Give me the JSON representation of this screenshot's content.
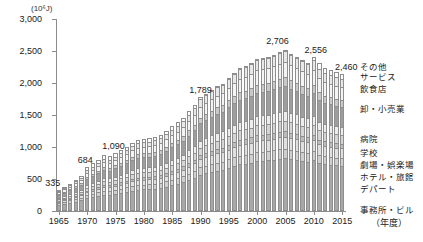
{
  "axis": {
    "unit_label": "(10⁶J)",
    "x_unit_label": "（年度）",
    "y_ticks": [
      "0",
      "500",
      "1,000",
      "1,500",
      "2,000",
      "2,500",
      "3,000"
    ],
    "x_ticks": [
      "1965",
      "1970",
      "1975",
      "1980",
      "1985",
      "1990",
      "1995",
      "2000",
      "2005",
      "2010",
      "2015"
    ]
  },
  "legend": {
    "items": [
      {
        "label": "その他",
        "color": "#e8e8e8"
      },
      {
        "label": "サービス",
        "color": "#f4f4f4"
      },
      {
        "label": "飲食店",
        "color": "#c9c9c9"
      },
      {
        "label": "卸・小売業",
        "color": "#9e9e9e"
      },
      {
        "label": "病院",
        "color": "#ededed"
      },
      {
        "label": "学校",
        "color": "#d5d5d5"
      },
      {
        "label": "劇場・娯楽場",
        "color": "#bdbdbd"
      },
      {
        "label": "ホテル・旅館",
        "color": "#e0e0e0"
      },
      {
        "label": "デパート",
        "color": "#cfcfcf"
      },
      {
        "label": "事務所・ビル",
        "color": "#a8a8a8"
      }
    ]
  },
  "chart_data": {
    "type": "bar",
    "stacked": true,
    "title": "",
    "xlabel": "（年度）",
    "ylabel": "(10⁶J)",
    "ylim": [
      0,
      3000
    ],
    "ytick_step": 500,
    "grid": false,
    "legend_position": "right",
    "categories": [
      1965,
      1966,
      1967,
      1968,
      1969,
      1970,
      1971,
      1972,
      1973,
      1974,
      1975,
      1976,
      1977,
      1978,
      1979,
      1980,
      1981,
      1982,
      1983,
      1984,
      1985,
      1986,
      1987,
      1988,
      1989,
      1990,
      1991,
      1992,
      1993,
      1994,
      1995,
      1996,
      1997,
      1998,
      1999,
      2000,
      2001,
      2002,
      2003,
      2004,
      2005,
      2006,
      2007,
      2008,
      2009,
      2010,
      2011,
      2012,
      2013,
      2014,
      2015
    ],
    "series": [
      {
        "name": "事務所・ビル",
        "color": "#a8a8a8",
        "values": [
          95,
          108,
          124,
          141,
          160,
          194,
          210,
          228,
          249,
          246,
          260,
          276,
          292,
          312,
          325,
          330,
          332,
          338,
          350,
          372,
          395,
          415,
          440,
          476,
          512,
          560,
          585,
          612,
          638,
          660,
          690,
          718,
          742,
          752,
          768,
          790,
          798,
          806,
          818,
          832,
          840,
          830,
          818,
          795,
          772,
          788,
          742,
          724,
          716,
          708,
          702
        ]
      },
      {
        "name": "デパート",
        "color": "#cfcfcf",
        "values": [
          30,
          33,
          37,
          41,
          46,
          55,
          58,
          62,
          66,
          65,
          67,
          70,
          72,
          76,
          78,
          79,
          79,
          80,
          82,
          86,
          90,
          93,
          97,
          103,
          109,
          117,
          120,
          124,
          128,
          131,
          135,
          139,
          142,
          143,
          145,
          148,
          148,
          149,
          150,
          152,
          153,
          150,
          147,
          142,
          137,
          139,
          130,
          126,
          124,
          122,
          120
        ]
      },
      {
        "name": "ホテル・旅館",
        "color": "#e0e0e0",
        "values": [
          22,
          25,
          28,
          32,
          36,
          44,
          48,
          52,
          57,
          57,
          61,
          65,
          69,
          74,
          78,
          80,
          81,
          83,
          86,
          91,
          96,
          101,
          107,
          115,
          123,
          133,
          139,
          145,
          151,
          156,
          163,
          169,
          175,
          177,
          181,
          186,
          187,
          188,
          190,
          193,
          195,
          192,
          188,
          182,
          176,
          179,
          168,
          163,
          160,
          157,
          155
        ]
      },
      {
        "name": "劇場・娯楽場",
        "color": "#bdbdbd",
        "values": [
          14,
          15,
          17,
          19,
          21,
          26,
          28,
          30,
          32,
          32,
          34,
          36,
          38,
          40,
          42,
          43,
          43,
          44,
          45,
          47,
          49,
          51,
          53,
          57,
          60,
          65,
          67,
          70,
          72,
          74,
          77,
          80,
          82,
          83,
          85,
          87,
          87,
          88,
          89,
          90,
          91,
          89,
          87,
          84,
          81,
          83,
          77,
          75,
          74,
          73,
          72
        ]
      },
      {
        "name": "学校",
        "color": "#d5d5d5",
        "values": [
          26,
          29,
          32,
          36,
          40,
          48,
          52,
          56,
          60,
          59,
          62,
          65,
          69,
          73,
          76,
          77,
          78,
          79,
          81,
          85,
          89,
          93,
          97,
          104,
          110,
          119,
          123,
          128,
          133,
          137,
          143,
          148,
          153,
          155,
          158,
          162,
          163,
          164,
          166,
          169,
          171,
          168,
          164,
          159,
          154,
          156,
          147,
          142,
          140,
          138,
          136
        ]
      },
      {
        "name": "病院",
        "color": "#ededed",
        "values": [
          23,
          26,
          29,
          32,
          36,
          43,
          47,
          50,
          54,
          54,
          57,
          60,
          63,
          67,
          70,
          71,
          72,
          73,
          75,
          79,
          83,
          86,
          91,
          97,
          103,
          111,
          115,
          120,
          125,
          129,
          134,
          139,
          143,
          145,
          148,
          152,
          153,
          154,
          156,
          158,
          160,
          157,
          154,
          149,
          144,
          146,
          138,
          134,
          131,
          129,
          128
        ]
      },
      {
        "name": "卸・小売業",
        "color": "#9e9e9e",
        "values": [
          52,
          58,
          65,
          74,
          83,
          101,
          109,
          118,
          128,
          127,
          134,
          142,
          151,
          161,
          168,
          170,
          172,
          175,
          180,
          190,
          200,
          210,
          220,
          235,
          250,
          272,
          283,
          296,
          308,
          318,
          332,
          344,
          355,
          360,
          367,
          377,
          380,
          383,
          388,
          394,
          398,
          392,
          384,
          372,
          360,
          366,
          345,
          334,
          329,
          324,
          320
        ]
      },
      {
        "name": "飲食店",
        "color": "#c9c9c9",
        "values": [
          18,
          20,
          23,
          26,
          29,
          35,
          38,
          41,
          45,
          44,
          47,
          50,
          53,
          56,
          59,
          60,
          60,
          61,
          63,
          66,
          70,
          73,
          77,
          82,
          87,
          95,
          99,
          103,
          107,
          111,
          116,
          120,
          124,
          126,
          128,
          132,
          133,
          134,
          136,
          138,
          139,
          137,
          134,
          130,
          126,
          128,
          120,
          117,
          115,
          113,
          112
        ]
      },
      {
        "name": "サービス",
        "color": "#f4f4f4",
        "values": [
          33,
          37,
          41,
          47,
          53,
          64,
          69,
          75,
          81,
          80,
          85,
          90,
          95,
          101,
          106,
          107,
          108,
          110,
          113,
          119,
          125,
          131,
          138,
          147,
          157,
          170,
          177,
          185,
          193,
          199,
          208,
          216,
          223,
          226,
          231,
          237,
          238,
          240,
          243,
          247,
          250,
          246,
          241,
          234,
          227,
          231,
          218,
          211,
          208,
          205,
          203
        ]
      },
      {
        "name": "その他",
        "color": "#e8e8e8",
        "values": [
          22,
          25,
          28,
          32,
          36,
          44,
          48,
          51,
          56,
          55,
          58,
          62,
          66,
          70,
          73,
          74,
          75,
          76,
          78,
          82,
          87,
          91,
          95,
          102,
          108,
          117,
          122,
          127,
          132,
          137,
          143,
          148,
          153,
          155,
          158,
          163,
          164,
          165,
          167,
          170,
          172,
          169,
          166,
          160,
          156,
          158,
          149,
          145,
          142,
          140,
          138
        ]
      }
    ],
    "totals": [
      335,
      376,
      424,
      480,
      540,
      684,
      744,
      803,
      868,
      859,
      905,
      956,
      1008,
      1070,
      1115,
      1131,
      1140,
      1159,
      1193,
      1257,
      1324,
      1385,
      1455,
      1558,
      1659,
      1789,
      1830,
      1890,
      1947,
      1992,
      2081,
      2161,
      2232,
      2262,
      2309,
      2374,
      2391,
      2411,
      2443,
      2483,
      2509,
      2460,
      2413,
      2357,
      2313,
      2404,
      2314,
      2231,
      2199,
      2169,
      2146
    ],
    "data_labels": [
      {
        "year": 1965,
        "text": "335"
      },
      {
        "year": 1970,
        "text": "684"
      },
      {
        "year": 1975,
        "text": "1,090"
      },
      {
        "year": 1990,
        "text": "1,789"
      },
      {
        "year": 2005,
        "text": "2,706"
      },
      {
        "year": 2010,
        "text": "2,556"
      },
      {
        "year": 2015,
        "text": "2,460"
      }
    ]
  }
}
